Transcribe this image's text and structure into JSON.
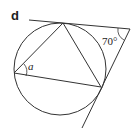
{
  "figure": {
    "part_label": "d",
    "angle_unknown": "a",
    "angle_given": "70°"
  }
}
